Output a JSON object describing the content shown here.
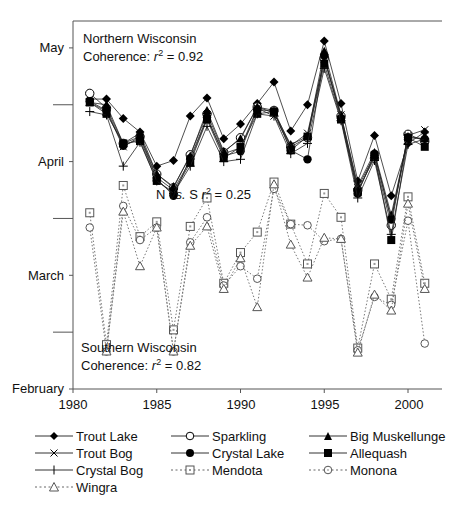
{
  "chart_data": {
    "type": "line",
    "title": "",
    "xlabel": "",
    "ylabel": "",
    "x_ticks": [
      1980,
      1985,
      1990,
      1995,
      2000
    ],
    "x_range": [
      1980,
      2002
    ],
    "y_ticks": [
      {
        "label": "February",
        "value": 0
      },
      {
        "label": "March",
        "value": 1
      },
      {
        "label": "April",
        "value": 2
      },
      {
        "label": "May",
        "value": 3
      }
    ],
    "y_minor_ticks": [
      0.5,
      1.5,
      2.5
    ],
    "y_range": [
      0,
      3.05
    ],
    "y_units": "months after Feb 1 (ice-off date)",
    "grid": false,
    "legend_position": "bottom",
    "annotations": [
      {
        "text_lines": [
          "Northern Wisconsin",
          "Coherence: r2 = 0.92"
        ],
        "position": "top-left"
      },
      {
        "text": "N vs. S r2 = 0.25",
        "position": "center"
      },
      {
        "text_lines": [
          "Southern Wisconsin",
          "Coherence: r2 = 0.82"
        ],
        "position": "bottom-left"
      }
    ],
    "x": [
      1981,
      1982,
      1983,
      1984,
      1985,
      1986,
      1987,
      1988,
      1989,
      1990,
      1991,
      1992,
      1993,
      1994,
      1995,
      1996,
      1997,
      1998,
      1999,
      2000,
      2001
    ],
    "series": [
      {
        "name": "Trout Lake",
        "group": "north",
        "marker": "diamond-filled",
        "line": "solid",
        "values": [
          2.55,
          2.55,
          2.38,
          2.26,
          1.96,
          2.01,
          2.4,
          2.56,
          2.2,
          2.33,
          2.51,
          2.7,
          2.27,
          2.5,
          3.06,
          2.51,
          1.83,
          2.23,
          1.7,
          2.16,
          2.26
        ]
      },
      {
        "name": "Sparkling",
        "group": "north",
        "marker": "circle-open",
        "line": "solid",
        "values": [
          2.6,
          2.47,
          2.16,
          2.22,
          1.89,
          1.77,
          2.06,
          2.42,
          2.08,
          2.21,
          2.48,
          2.45,
          2.13,
          2.21,
          2.91,
          2.4,
          1.75,
          2.03,
          1.44,
          2.24,
          2.18
        ]
      },
      {
        "name": "Big Muskellunge",
        "group": "north",
        "marker": "triangle-filled",
        "line": "solid",
        "values": [
          2.52,
          2.5,
          2.16,
          2.25,
          1.89,
          1.78,
          2.05,
          2.45,
          2.09,
          2.2,
          2.48,
          2.43,
          2.15,
          2.22,
          2.97,
          2.41,
          1.79,
          2.08,
          1.53,
          2.22,
          2.2
        ]
      },
      {
        "name": "Trout Bog",
        "group": "north",
        "marker": "x",
        "line": "solid",
        "values": [
          2.52,
          2.44,
          2.13,
          2.22,
          1.86,
          1.75,
          2.01,
          2.38,
          2.07,
          2.12,
          2.47,
          2.4,
          2.14,
          2.25,
          2.9,
          2.41,
          1.77,
          2.06,
          1.49,
          2.23,
          2.28
        ]
      },
      {
        "name": "Crystal Lake",
        "group": "north",
        "marker": "circle-filled",
        "line": "solid",
        "values": [
          2.53,
          2.45,
          2.14,
          2.2,
          1.85,
          1.7,
          2.03,
          2.39,
          2.05,
          2.09,
          2.46,
          2.44,
          2.1,
          2.02,
          2.93,
          2.38,
          1.72,
          2.07,
          1.49,
          2.21,
          2.2
        ]
      },
      {
        "name": "Allequash",
        "group": "north",
        "marker": "square-filled",
        "line": "solid",
        "values": [
          2.52,
          2.42,
          2.16,
          2.18,
          1.83,
          1.73,
          1.99,
          2.37,
          2.03,
          2.13,
          2.42,
          2.44,
          2.1,
          2.22,
          2.86,
          2.37,
          1.73,
          2.05,
          1.31,
          2.21,
          2.13
        ]
      },
      {
        "name": "Crystal Bog",
        "group": "north",
        "marker": "plus",
        "line": "solid",
        "values": [
          2.44,
          2.41,
          1.96,
          2.17,
          1.83,
          1.72,
          1.96,
          2.31,
          2.0,
          2.02,
          2.42,
          2.4,
          2.07,
          2.16,
          2.82,
          2.36,
          1.68,
          2.01,
          1.36,
          2.15,
          2.2
        ]
      },
      {
        "name": "Mendota",
        "group": "south",
        "marker": "square-open",
        "line": "dotted",
        "values": [
          1.55,
          0.39,
          1.79,
          1.34,
          1.47,
          0.52,
          1.43,
          1.68,
          0.93,
          1.2,
          1.38,
          1.82,
          1.45,
          1.1,
          1.72,
          1.51,
          0.36,
          1.1,
          0.79,
          1.69,
          0.93
        ]
      },
      {
        "name": "Monona",
        "group": "south",
        "marker": "circle-open-small",
        "line": "dotted",
        "values": [
          1.42,
          0.33,
          1.61,
          1.31,
          1.42,
          0.33,
          1.29,
          1.51,
          0.91,
          1.08,
          0.97,
          1.76,
          1.45,
          1.44,
          1.3,
          1.32,
          0.34,
          0.81,
          0.74,
          1.48,
          0.4
        ]
      },
      {
        "name": "Wingra",
        "group": "south",
        "marker": "triangle-open",
        "line": "dotted",
        "values": [
          null,
          0.33,
          1.56,
          1.08,
          1.42,
          0.33,
          1.26,
          1.43,
          0.88,
          1.15,
          0.72,
          1.8,
          1.27,
          0.98,
          1.33,
          1.32,
          0.32,
          0.83,
          0.69,
          1.63,
          0.88
        ]
      }
    ]
  },
  "axes": {
    "y_labels": [
      "May",
      "April",
      "March",
      "February"
    ],
    "x_labels": [
      "1980",
      "1985",
      "1990",
      "1995",
      "2000"
    ]
  },
  "annotations": {
    "north_title": "Northern Wisconsin",
    "north_coherence_prefix": "Coherence: ",
    "north_r": "r",
    "north_sup": "2",
    "north_value": " = 0.92",
    "ns_prefix": "N ",
    "ns_vs": "vs.",
    "ns_mid": " S ",
    "ns_r": "r",
    "ns_sup": "2",
    "ns_value": " = 0.25",
    "south_title": "Southern Wisconsin",
    "south_coherence_prefix": "Coherence: ",
    "south_r": "r",
    "south_sup": "2",
    "south_value": " = 0.82"
  },
  "legend": {
    "items": [
      {
        "label": "Trout Lake"
      },
      {
        "label": "Sparkling"
      },
      {
        "label": "Big Muskellunge"
      },
      {
        "label": "Trout Bog"
      },
      {
        "label": "Crystal Lake"
      },
      {
        "label": "Allequash"
      },
      {
        "label": "Crystal Bog"
      },
      {
        "label": "Mendota"
      },
      {
        "label": "Monona"
      },
      {
        "label": "Wingra"
      }
    ]
  }
}
